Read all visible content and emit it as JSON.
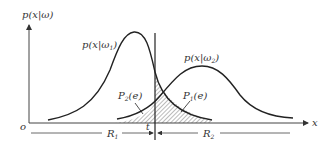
{
  "diagram": {
    "type": "bayes-decision-error",
    "y_axis_label": "p(x|ω)",
    "x_axis_label": "x",
    "origin_label": "o",
    "threshold_label": "t",
    "curve1": {
      "label_main": "p(x|ω",
      "label_sub": "1",
      "label_close": ")"
    },
    "curve2": {
      "label_main": "p(x|ω",
      "label_sub": "2",
      "label_close": ")"
    },
    "error1": {
      "label_main": "P",
      "label_sub": "1",
      "label_arg": "(e)"
    },
    "error2": {
      "label_main": "P",
      "label_sub": "2",
      "label_arg": "(e)"
    },
    "region1": {
      "label_main": "R",
      "label_sub": "1"
    },
    "region2": {
      "label_main": "R",
      "label_sub": "2"
    },
    "colors": {
      "stroke": "#222222",
      "hatch": "#555555",
      "background": "#ffffff"
    }
  }
}
